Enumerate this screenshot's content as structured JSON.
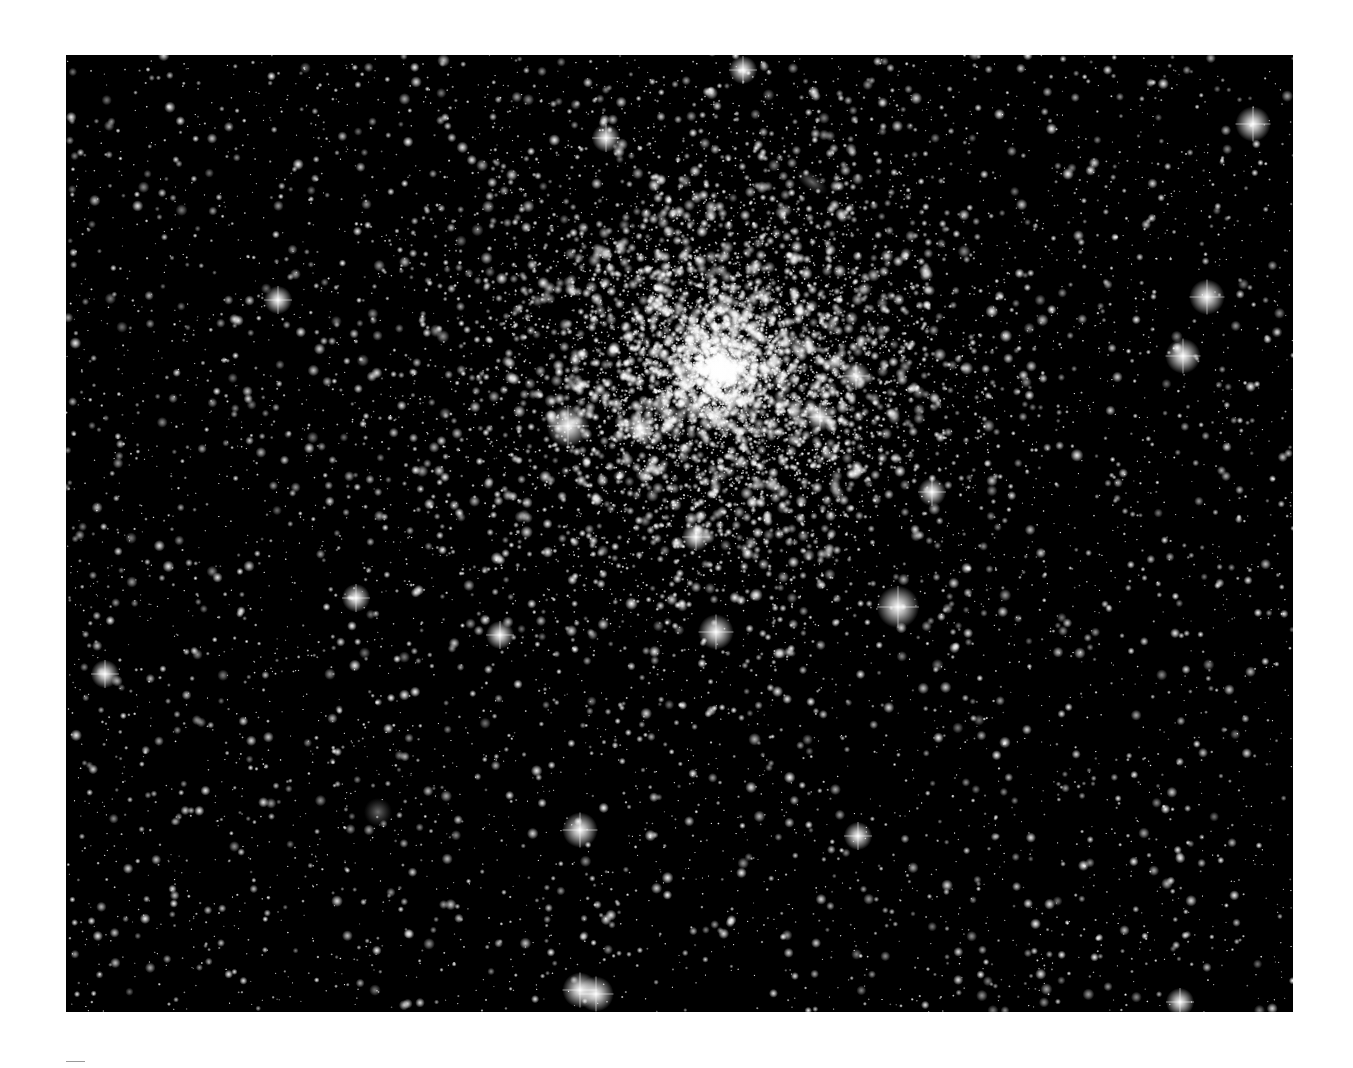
{
  "image": {
    "subject": "globular star cluster field",
    "background_color": "#000000",
    "star_color": "#ffffff",
    "frame": {
      "x": 66,
      "y": 55,
      "width": 1227,
      "height": 957
    },
    "cluster_center": {
      "x": 720,
      "y": 370
    },
    "cluster_radius": 330,
    "bright_stars": [
      {
        "x": 1253,
        "y": 124,
        "r": 5
      },
      {
        "x": 1207,
        "y": 297,
        "r": 5
      },
      {
        "x": 1183,
        "y": 356,
        "r": 5
      },
      {
        "x": 898,
        "y": 607,
        "r": 6
      },
      {
        "x": 580,
        "y": 990,
        "r": 5
      },
      {
        "x": 596,
        "y": 994,
        "r": 5
      },
      {
        "x": 568,
        "y": 426,
        "r": 6
      },
      {
        "x": 580,
        "y": 830,
        "r": 5
      },
      {
        "x": 743,
        "y": 70,
        "r": 4
      },
      {
        "x": 932,
        "y": 492,
        "r": 4
      },
      {
        "x": 716,
        "y": 632,
        "r": 5
      },
      {
        "x": 500,
        "y": 635,
        "r": 4
      },
      {
        "x": 356,
        "y": 598,
        "r": 4
      },
      {
        "x": 105,
        "y": 674,
        "r": 4
      },
      {
        "x": 278,
        "y": 300,
        "r": 4
      },
      {
        "x": 1180,
        "y": 1002,
        "r": 4
      },
      {
        "x": 858,
        "y": 836,
        "r": 4
      },
      {
        "x": 606,
        "y": 138,
        "r": 4
      },
      {
        "x": 820,
        "y": 417,
        "r": 4
      },
      {
        "x": 640,
        "y": 428,
        "r": 4
      },
      {
        "x": 696,
        "y": 537,
        "r": 4
      },
      {
        "x": 856,
        "y": 376,
        "r": 4
      }
    ],
    "diffuse_objects": [
      {
        "type": "nebula",
        "x": 378,
        "y": 812,
        "rx": 14,
        "ry": 14
      },
      {
        "type": "galaxy",
        "x": 812,
        "y": 182,
        "rx": 18,
        "ry": 8,
        "angle": 35
      }
    ]
  },
  "caption_rule": {
    "color": "#9a9a9a"
  }
}
